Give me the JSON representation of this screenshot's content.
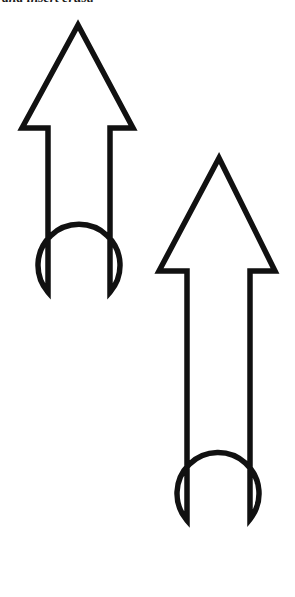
{
  "page": {
    "width": 295,
    "height": 597,
    "background_color": "#ffffff"
  },
  "caption": {
    "text": "and insert crust.",
    "note": "clipped text line at top edge of page"
  },
  "figure": {
    "stroke_color": "#111111",
    "fill_color": "#ffffff",
    "stroke_width": 5.5,
    "shapes": [
      {
        "name": "arrow-one",
        "label": "upper-left arrow",
        "apex_x": 78,
        "apex_y": 25,
        "barb_y": 128,
        "barb_left_x": 22,
        "barb_right_x": 133,
        "shaft_left_x": 48,
        "shaft_right_x": 110,
        "bulb_center_x": 79,
        "bulb_center_y": 319,
        "bulb_radius": 41
      },
      {
        "name": "arrow-two",
        "label": "lower-right arrow",
        "apex_x": 219,
        "apex_y": 158,
        "barb_y": 271,
        "barb_left_x": 159,
        "barb_right_x": 275,
        "shaft_left_x": 187,
        "shaft_right_x": 250,
        "bulb_center_x": 219,
        "bulb_center_y": 546,
        "bulb_radius": 41
      }
    ]
  }
}
